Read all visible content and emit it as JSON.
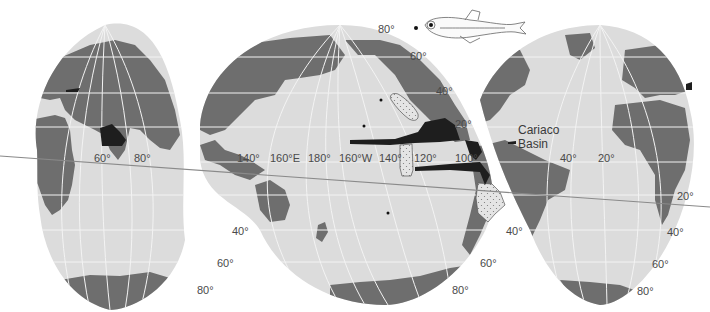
{
  "figure": {
    "type": "interrupted world map (oxygen minimum zones)",
    "colors": {
      "ocean": "#dcdcdc",
      "land": "#6e6e6e",
      "omz": "#1e1e1e",
      "graticule": "#f5f5f5",
      "background": "#ffffff",
      "equator_line": "#8a8a8a",
      "label": "#4a4a4a"
    }
  },
  "labels": {
    "lon": {
      "l60": "60°",
      "l80": "80°",
      "l140": "140°",
      "l160e": "160°E",
      "l180": "180°",
      "l160w": "160°W",
      "l140b": "140°",
      "l120": "120°",
      "l100": "100°",
      "l40": "40°",
      "l20": "20°"
    },
    "lat": {
      "pac_n80": "80°",
      "pac_n60": "60°",
      "pac_n40": "40°",
      "pac_n20": "20°",
      "right_s20": "20°",
      "right_s40": "40°",
      "right_s60": "60°",
      "right_s80": "80°",
      "left_s40": "40°",
      "left_s60": "60°",
      "left_s80": "80°",
      "mid_s40": "40°",
      "mid_s60": "60°",
      "mid_s80": "80°"
    },
    "place": {
      "line1": "Cariaco",
      "line2": "Basin"
    }
  },
  "legend_icons": [
    "fish-illustration"
  ],
  "markers": [
    {
      "name": "station-dot-north",
      "x": 416,
      "y": 28
    },
    {
      "name": "station-dot-pacific-1",
      "x": 381,
      "y": 100
    },
    {
      "name": "station-dot-pacific-2",
      "x": 364,
      "y": 126
    },
    {
      "name": "station-dot-south-pacific",
      "x": 388,
      "y": 213
    }
  ]
}
